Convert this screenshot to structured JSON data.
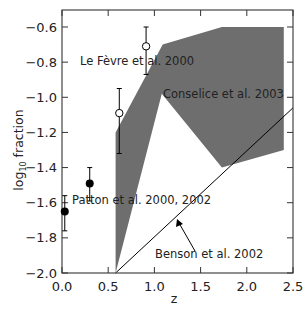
{
  "chart_data": {
    "type": "scatter",
    "title": "",
    "xlabel": "z",
    "ylabel": "log10 fraction",
    "ylabel_main": "log",
    "ylabel_sub": "10",
    "ylabel_rest": " fraction",
    "xlim": [
      0.0,
      2.5
    ],
    "ylim": [
      -2.0,
      -0.55
    ],
    "xticks": [
      0.0,
      0.5,
      1.0,
      1.5,
      2.0,
      2.5
    ],
    "xtick_labels": [
      "0.0",
      "0.5",
      "1.0",
      "1.5",
      "2.0",
      "2.5"
    ],
    "yticks": [
      -0.6,
      -0.8,
      -1.0,
      -1.2,
      -1.4,
      -1.6,
      -1.8,
      -2.0
    ],
    "ytick_labels": [
      "−0.6",
      "−0.8",
      "−1.0",
      "−1.2",
      "−1.4",
      "−1.6",
      "−1.8",
      "−2.0"
    ],
    "grid": false,
    "series": [
      {
        "name": "Patton et al. 2000, 2002",
        "marker": "filled-circle",
        "points": [
          {
            "x": 0.03,
            "y": -1.65,
            "ylow": -1.76,
            "yhigh": -1.56
          },
          {
            "x": 0.3,
            "y": -1.49,
            "ylow": -1.59,
            "yhigh": -1.4
          }
        ]
      },
      {
        "name": "Le Fèvre et al. 2000",
        "marker": "open-circle",
        "points": [
          {
            "x": 0.62,
            "y": -1.09,
            "ylow": -1.32,
            "yhigh": -0.95
          },
          {
            "x": 0.91,
            "y": -0.71,
            "ylow": -0.87,
            "yhigh": -0.6
          }
        ]
      },
      {
        "name": "Conselice et al. 2003",
        "type": "filled-region",
        "color": "#6e6e6e",
        "polygon": [
          [
            0.58,
            -2.0
          ],
          [
            0.58,
            -1.2
          ],
          [
            1.09,
            -0.7
          ],
          [
            1.73,
            -0.6
          ],
          [
            2.4,
            -0.6
          ],
          [
            2.4,
            -1.3
          ],
          [
            1.73,
            -1.4
          ],
          [
            1.08,
            -0.98
          ]
        ]
      },
      {
        "name": "Benson et al. 2002",
        "type": "line",
        "color": "#000000",
        "points": [
          [
            0.58,
            -2.0
          ],
          [
            2.5,
            -1.06
          ]
        ]
      }
    ],
    "annotations": [
      {
        "text": "Le Fèvre et al. 2000",
        "x": 0.5,
        "y": -0.8
      },
      {
        "text": "Conselice et al. 2003",
        "x": 1.08,
        "y": -0.99
      },
      {
        "text": "Patton et al. 2000, 2002",
        "x": 0.3,
        "y": -1.6
      },
      {
        "text": "Benson et al. 2002",
        "x": 1.0,
        "y": -1.87,
        "arrow_to": [
          1.25,
          -1.7
        ]
      }
    ]
  }
}
